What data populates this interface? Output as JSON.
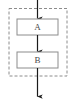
{
  "diagram": {
    "canvas": {
      "width": 76,
      "height": 99,
      "background": "#ffffff"
    },
    "group": {
      "name": "dashed-group",
      "stroke": "#8c8c8c",
      "dash": "3 2",
      "x": 9,
      "y": 8.5,
      "width": 58,
      "height": 67.5
    },
    "nodes": [
      {
        "id": "node-a",
        "label": "A",
        "x": 17,
        "y": 19,
        "width": 41,
        "height": 16,
        "stroke": "#8c8c8c",
        "fill": "#ffffff",
        "text_color": "#4a4a4a"
      },
      {
        "id": "node-b",
        "label": "B",
        "x": 17,
        "y": 52,
        "width": 41,
        "height": 16,
        "stroke": "#8c8c8c",
        "fill": "#ffffff",
        "text_color": "#4a4a4a"
      }
    ],
    "edges": [
      {
        "id": "edge-in",
        "from": "entry",
        "to": "node-a",
        "x": 37.5,
        "y1": 0,
        "y2": 19,
        "color": "#1a1a1a"
      },
      {
        "id": "edge-a-b",
        "from": "node-a",
        "to": "node-b",
        "x": 37.5,
        "y1": 35,
        "y2": 52,
        "color": "#1a1a1a"
      },
      {
        "id": "edge-out",
        "from": "node-b",
        "to": "exit",
        "x": 37.5,
        "y1": 68,
        "y2": 97,
        "color": "#1a1a1a"
      }
    ]
  }
}
